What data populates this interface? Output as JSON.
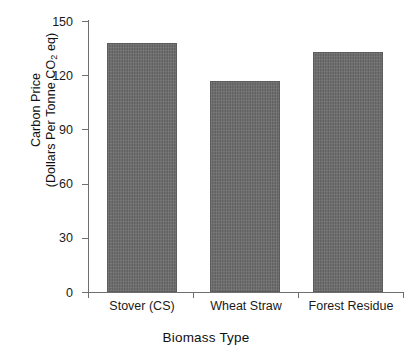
{
  "chart_data": {
    "type": "bar",
    "title": "",
    "categories": [
      "Stover (CS)",
      "Wheat Straw",
      "Forest Residue"
    ],
    "values": [
      138,
      117,
      133
    ],
    "xlabel": "Biomass Type",
    "ylabel_line1": "Carbon Price",
    "ylabel_line2_pre": "(Dollars Per Tonne CO",
    "ylabel_line2_sub": "2",
    "ylabel_line2_post": " eq)",
    "ylim": [
      0,
      150
    ],
    "yticks": [
      0,
      30,
      60,
      90,
      120,
      150
    ],
    "ytick_labels": [
      "0",
      "30",
      "60",
      "90",
      "120",
      "150"
    ],
    "grid": false,
    "legend": false,
    "bar_color": "#6b6b6b",
    "bar_edge_color": "#5c5c5c",
    "axis_color": "#6f6f6f"
  }
}
